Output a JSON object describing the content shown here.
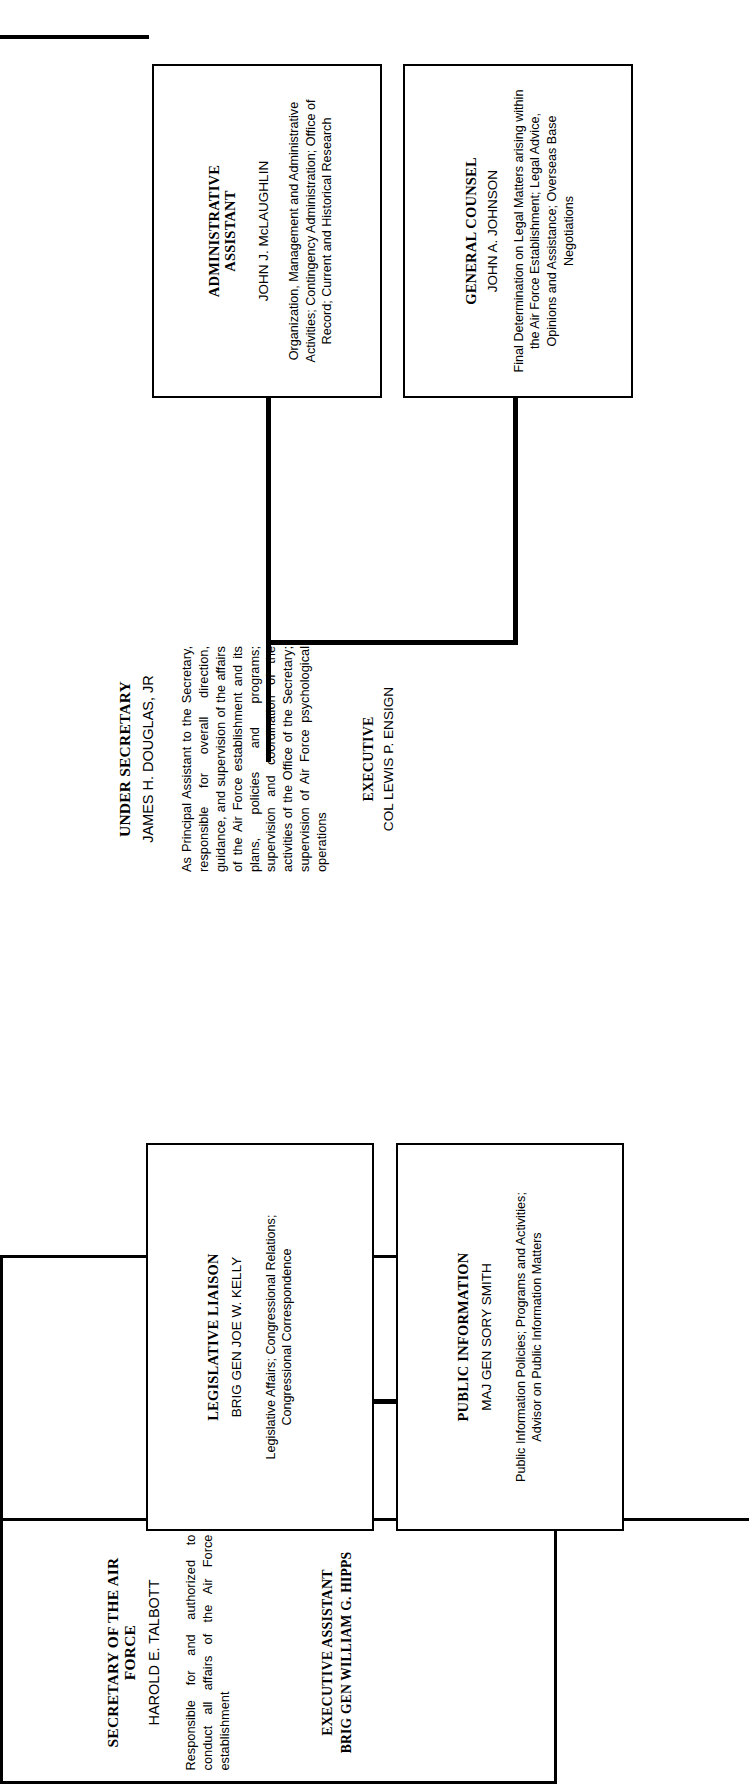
{
  "chart_title": "United States Air Force Secretariat Organization Chart",
  "nodes": {
    "secretary": {
      "title": "SECRETARY OF THE AIR FORCE",
      "person": "HAROLD E. TALBOTT",
      "description": "Responsible for and authorized to conduct all affairs of the Air Force establishment",
      "sub_title": "EXECUTIVE ASSISTANT",
      "sub_person": "BRIG GEN WILLIAM G. HIPPS"
    },
    "under_secretary": {
      "title": "UNDER SECRETARY",
      "person": "JAMES H. DOUGLAS, JR",
      "description": "As Principal Assistant to the Secretary, responsible for overall direction, guidance, and supervision of the affairs of the Air Force establishment and its plans, policies and programs; supervision and coordination of the activities of the Office of the Secretary; supervision of Air Force psychological operations",
      "sub_title": "EXECUTIVE",
      "sub_person": "COL LEWIS P. ENSIGN"
    },
    "administrative_assistant": {
      "title": "ADMINISTRATIVE ASSISTANT",
      "person": "JOHN J. McLAUGHLIN",
      "description": "Organization, Management and Administrative Activities; Contingency Administration; Office of Record; Current and Historical Research"
    },
    "general_counsel": {
      "title": "GENERAL COUNSEL",
      "person": "JOHN A. JOHNSON",
      "description": "Final Determination on Legal Matters arising within the Air Force Establishment; Legal Advice, Opinions and Assistance; Overseas Base Negotiations"
    },
    "legislative_liaison": {
      "title": "LEGISLATIVE LIAISON",
      "person": "BRIG GEN JOE W. KELLY",
      "description": "Legislative Affairs; Congressional Relations; Congressional Correspondence"
    },
    "public_information": {
      "title": "PUBLIC INFORMATION",
      "person": "MAJ GEN SORY SMITH",
      "description": "Public Information Policies; Programs and Activities; Advisor on Public Information Matters"
    }
  },
  "colors": {
    "line": "#000000",
    "background": "#ffffff",
    "text": "#000000"
  }
}
